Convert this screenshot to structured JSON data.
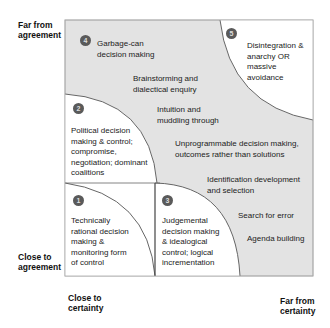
{
  "axes": {
    "y_top": "Far from agreement",
    "y_bottom": "Close to agreement",
    "x_left": "Close to certainty",
    "x_right": "Far from certainty"
  },
  "colors": {
    "shaded_zone": "#e3e3e3",
    "white_zone": "#ffffff",
    "border": "#888888",
    "number_badge": "#5a5a5a"
  },
  "regions": [
    {
      "number": "1",
      "label": "Technically rational decision making & monitoring form of control"
    },
    {
      "number": "2",
      "label": "Political decision making & control; compromise, negotiation; dominant coalitions"
    },
    {
      "number": "3",
      "label": "Judgemental decision making & idealogical control; logical incrementation"
    },
    {
      "number": "4",
      "label": "Garbage-can decision making"
    },
    {
      "number": "5",
      "label": "Disintegration & anarchy OR massive avoidance"
    }
  ],
  "zone_items": [
    "Brainstorming and dialectical enquiry",
    "Intuition and muddling through",
    "Unprogrammable decision making, outcomes rather than solutions",
    "Identification development and selection",
    "Search for error",
    "Agenda building"
  ]
}
